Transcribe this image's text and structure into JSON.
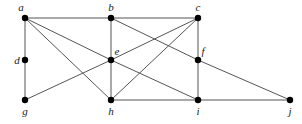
{
  "diagram": {
    "type": "undirected-graph",
    "colors": {
      "edge": "#555555",
      "vertex": "#000000",
      "label": "#222222",
      "background": "#ffffff"
    },
    "vertices": [
      {
        "id": "a",
        "label": "a",
        "x": 25,
        "y": 18,
        "lx": 21,
        "ly": 11,
        "anchor": "middle"
      },
      {
        "id": "b",
        "label": "b",
        "x": 111,
        "y": 18,
        "lx": 111,
        "ly": 11,
        "anchor": "middle"
      },
      {
        "id": "c",
        "label": "c",
        "x": 198,
        "y": 18,
        "lx": 198,
        "ly": 11,
        "anchor": "middle"
      },
      {
        "id": "d",
        "label": "d",
        "x": 25,
        "y": 60,
        "lx": 17,
        "ly": 64,
        "anchor": "middle"
      },
      {
        "id": "e",
        "label": "e",
        "x": 111,
        "y": 60,
        "lx": 117,
        "ly": 55,
        "anchor": "middle"
      },
      {
        "id": "f",
        "label": "f",
        "x": 198,
        "y": 60,
        "lx": 203,
        "ly": 55,
        "anchor": "middle"
      },
      {
        "id": "g",
        "label": "g",
        "x": 25,
        "y": 100,
        "lx": 25,
        "ly": 115,
        "anchor": "middle"
      },
      {
        "id": "h",
        "label": "h",
        "x": 111,
        "y": 100,
        "lx": 111,
        "ly": 115,
        "anchor": "middle"
      },
      {
        "id": "i",
        "label": "i",
        "x": 198,
        "y": 100,
        "lx": 198,
        "ly": 115,
        "anchor": "middle"
      },
      {
        "id": "j",
        "label": "j",
        "x": 290,
        "y": 100,
        "lx": 290,
        "ly": 115,
        "anchor": "middle"
      }
    ],
    "edges": [
      [
        "a",
        "b"
      ],
      [
        "b",
        "c"
      ],
      [
        "a",
        "d"
      ],
      [
        "d",
        "g"
      ],
      [
        "a",
        "e"
      ],
      [
        "a",
        "h"
      ],
      [
        "b",
        "e"
      ],
      [
        "e",
        "h"
      ],
      [
        "b",
        "f"
      ],
      [
        "f",
        "j"
      ],
      [
        "c",
        "f"
      ],
      [
        "f",
        "i"
      ],
      [
        "c",
        "e"
      ],
      [
        "c",
        "h"
      ],
      [
        "e",
        "g"
      ],
      [
        "e",
        "i"
      ],
      [
        "h",
        "i"
      ],
      [
        "i",
        "j"
      ]
    ]
  }
}
